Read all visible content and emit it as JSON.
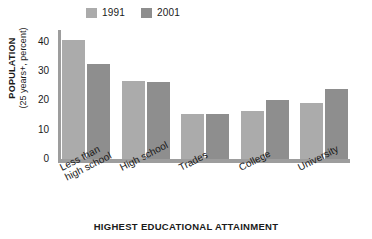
{
  "chart_data": {
    "type": "bar",
    "title": "",
    "xlabel": "HIGHEST EDUCATIONAL ATTAINMENT",
    "ylabel": "POPULATION",
    "ylabel_sub": "(25 years+, percent)",
    "categories": [
      "Less than\nhigh school",
      "High school",
      "Trades",
      "College",
      "University"
    ],
    "series": [
      {
        "name": "1991",
        "color": "#ababab",
        "values": [
          40.5,
          26.5,
          15.5,
          16.5,
          19
        ]
      },
      {
        "name": "2001",
        "color": "#8e8e8e",
        "values": [
          32.5,
          26.3,
          15.5,
          20,
          24
        ]
      }
    ],
    "ylim": [
      0,
      44
    ],
    "yticks": [
      0,
      10,
      20,
      30,
      40
    ],
    "grid": false,
    "legend_position": "top-left"
  },
  "legend": {
    "entries": [
      {
        "label": "1991",
        "swatch": "legend-swatch-1991"
      },
      {
        "label": "2001",
        "swatch": "legend-swatch-2001"
      }
    ]
  },
  "axis": {
    "y_title_main": "POPULATION",
    "y_title_sub": "(25 years+, percent)",
    "x_title": "HIGHEST EDUCATIONAL ATTAINMENT",
    "y_ticks": [
      "40",
      "30",
      "20",
      "10",
      "0"
    ]
  },
  "colors": {
    "series_1991": "#ababab",
    "series_2001": "#8e8e8e",
    "axis_line": "#9d9d9d",
    "text": "#1a1a1a",
    "background": "#ffffff"
  }
}
